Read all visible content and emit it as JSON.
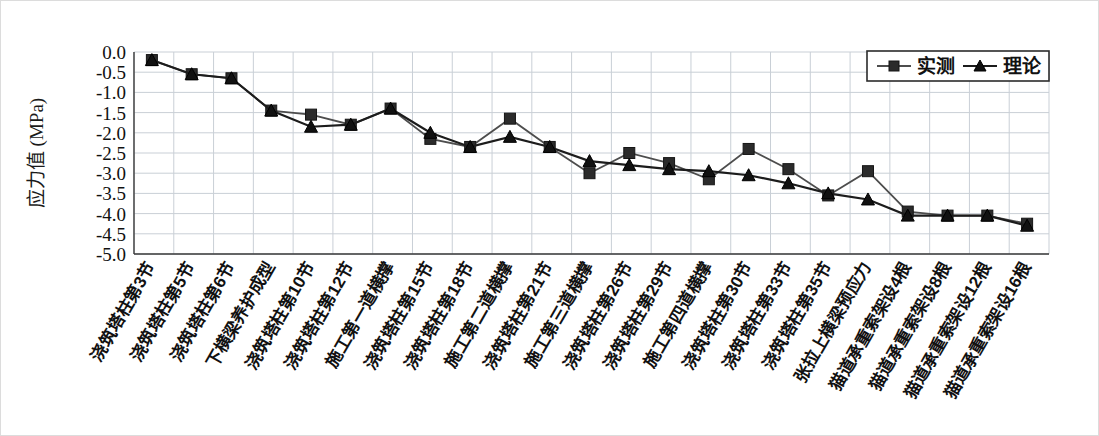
{
  "chart_data": {
    "type": "line",
    "title": "",
    "xlabel": "",
    "ylabel": "应力值 (MPa)",
    "ylim": [
      -5.0,
      0.0
    ],
    "yticks": [
      "0.0",
      "-0.5",
      "-1.0",
      "-1.5",
      "-2.0",
      "-2.5",
      "-3.0",
      "-3.5",
      "-4.0",
      "-4.5",
      "-5.0"
    ],
    "ytick_values": [
      0.0,
      -0.5,
      -1.0,
      -1.5,
      -2.0,
      -2.5,
      -3.0,
      -3.5,
      -4.0,
      -4.5,
      -5.0
    ],
    "grid": true,
    "legend_position": "top-right",
    "categories": [
      "浇筑塔柱第3节",
      "浇筑塔柱第5节",
      "浇筑塔柱第6节",
      "下横梁养护成型",
      "浇筑塔柱第10节",
      "浇筑塔柱第12节",
      "施工第一道横撑",
      "浇筑塔柱第15节",
      "浇筑塔柱第18节",
      "施工第二道横撑",
      "浇筑塔柱第21节",
      "施工第三道横撑",
      "浇筑塔柱第26节",
      "浇筑塔柱第29节",
      "施工第四道横撑",
      "浇筑塔柱第30节",
      "浇筑塔柱第33节",
      "浇筑塔柱第35节",
      "张拉上横梁预应力",
      "猫道承重索架设4根",
      "猫道承重索架设8根",
      "猫道承重索架设12根",
      "猫道承重索架设16根"
    ],
    "series": [
      {
        "name": "实测",
        "marker": "square",
        "color": "#2b2b2b",
        "values": [
          -0.2,
          -0.55,
          -0.65,
          -1.45,
          -1.55,
          -1.8,
          -1.4,
          -2.15,
          -2.35,
          -1.65,
          -2.35,
          -3.0,
          -2.5,
          -2.75,
          -3.15,
          -2.4,
          -2.9,
          -3.55,
          -2.95,
          -3.95,
          -4.05,
          -4.05,
          -4.25
        ]
      },
      {
        "name": "理论",
        "marker": "triangle",
        "color": "#111111",
        "values": [
          -0.2,
          -0.55,
          -0.65,
          -1.45,
          -1.85,
          -1.8,
          -1.4,
          -2.0,
          -2.35,
          -2.1,
          -2.35,
          -2.7,
          -2.8,
          -2.9,
          -2.95,
          -3.05,
          -3.25,
          -3.5,
          -3.65,
          -4.05,
          -4.05,
          -4.05,
          -4.3
        ]
      }
    ]
  },
  "legend": {
    "items": [
      {
        "label": "实测",
        "marker": "square"
      },
      {
        "label": "理论",
        "marker": "triangle"
      }
    ]
  }
}
